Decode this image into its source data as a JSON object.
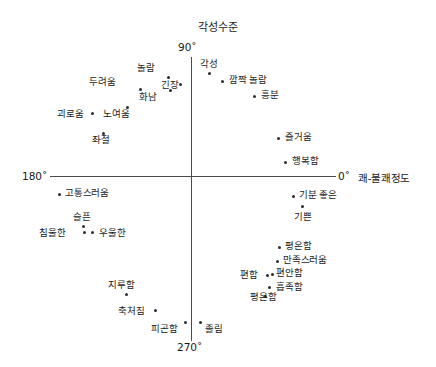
{
  "chart": {
    "title": "각성수준",
    "x_axis_title": "쾌-불쾌정도",
    "tick_top": "90˚",
    "tick_bottom": "270˚",
    "tick_left": "180˚",
    "tick_right": "0˚"
  },
  "chart_data": {
    "type": "scatter",
    "title": "각성수준",
    "xlabel": "쾌-불쾌정도",
    "ylabel": "각성수준",
    "xlim": [
      -100,
      100
    ],
    "ylim": [
      -100,
      100
    ],
    "grid": false,
    "legend": null,
    "annotations": [
      {
        "text": "90˚",
        "position": "top-axis"
      },
      {
        "text": "270˚",
        "position": "bottom-axis"
      },
      {
        "text": "180˚",
        "position": "left-axis"
      },
      {
        "text": "0˚",
        "position": "right-axis"
      }
    ],
    "points": [
      {
        "label": "각성",
        "x": 13,
        "y": 72,
        "px": 209,
        "py": 73,
        "lx": 200,
        "ly": 58,
        "align": "left"
      },
      {
        "label": "깜짝 놀람",
        "x": 22,
        "y": 66,
        "px": 222,
        "py": 81,
        "lx": 229,
        "ly": 74,
        "align": "left"
      },
      {
        "label": "흥분",
        "x": 44,
        "y": 56,
        "px": 254,
        "py": 96,
        "lx": 261,
        "ly": 89,
        "align": "left"
      },
      {
        "label": "즐거움",
        "x": 61,
        "y": 27,
        "px": 278,
        "py": 138,
        "lx": 285,
        "ly": 131,
        "align": "left"
      },
      {
        "label": "행복함",
        "x": 66,
        "y": 10,
        "px": 285,
        "py": 162,
        "lx": 292,
        "ly": 155,
        "align": "left"
      },
      {
        "label": "놀람",
        "x": -16,
        "y": 70,
        "px": 168,
        "py": 77,
        "lx": 137,
        "ly": 62,
        "align": "left"
      },
      {
        "label": "긴장",
        "x": -8,
        "y": 65,
        "px": 180,
        "py": 84,
        "lx": 161,
        "ly": 79,
        "align": "left"
      },
      {
        "label": "두려움",
        "x": -36,
        "y": 62,
        "px": 140,
        "py": 89,
        "lx": 89,
        "ly": 76,
        "align": "left"
      },
      {
        "label": "화남",
        "x": -15,
        "y": 61,
        "px": 170,
        "py": 90,
        "lx": 139,
        "ly": 91,
        "align": "left"
      },
      {
        "label": "노여움",
        "x": -45,
        "y": 49,
        "px": 127,
        "py": 107,
        "lx": 103,
        "ly": 108,
        "align": "left"
      },
      {
        "label": "괴로움",
        "x": -69,
        "y": 44,
        "px": 92,
        "py": 113,
        "lx": 57,
        "ly": 108,
        "align": "left"
      },
      {
        "label": "좌절",
        "x": -62,
        "y": 30,
        "px": 103,
        "py": 133,
        "lx": 92,
        "ly": 134,
        "align": "left"
      },
      {
        "label": "고통스러움",
        "x": -92,
        "y": -13,
        "px": 59,
        "py": 194,
        "lx": 65,
        "ly": 187,
        "align": "left"
      },
      {
        "label": "슬픈",
        "x": -75,
        "y": -35,
        "px": 83,
        "py": 226,
        "lx": 73,
        "ly": 211,
        "align": "left"
      },
      {
        "label": "침울한",
        "x": -75,
        "y": -39,
        "px": 84,
        "py": 232,
        "lx": 39,
        "ly": 227,
        "align": "left"
      },
      {
        "label": "우울한",
        "x": -69,
        "y": -39,
        "px": 92,
        "py": 232,
        "lx": 99,
        "ly": 227,
        "align": "left"
      },
      {
        "label": "기분 좋은",
        "x": 71,
        "y": -14,
        "px": 293,
        "py": 196,
        "lx": 299,
        "ly": 189,
        "align": "left"
      },
      {
        "label": "기쁜",
        "x": 78,
        "y": -21,
        "px": 302,
        "py": 206,
        "lx": 294,
        "ly": 211,
        "align": "left"
      },
      {
        "label": "평온함",
        "x": 62,
        "y": -50,
        "px": 279,
        "py": 247,
        "lx": 285,
        "ly": 240,
        "align": "left"
      },
      {
        "label": "만족스러움",
        "x": 60,
        "y": -60,
        "px": 277,
        "py": 261,
        "lx": 283,
        "ly": 254,
        "align": "left"
      },
      {
        "label": "편함",
        "x": 53,
        "y": -69,
        "px": 267,
        "py": 275,
        "lx": 240,
        "ly": 269,
        "align": "left"
      },
      {
        "label": "편안함",
        "x": 57,
        "y": -69,
        "px": 272,
        "py": 274,
        "lx": 276,
        "ly": 267,
        "align": "left"
      },
      {
        "label": "흡족함",
        "x": 55,
        "y": -78,
        "px": 269,
        "py": 287,
        "lx": 276,
        "ly": 281,
        "align": "left"
      },
      {
        "label": "평온함",
        "x": 50,
        "y": -85,
        "px": 265,
        "py": 296,
        "lx": 250,
        "ly": 291,
        "align": "left"
      },
      {
        "label": "지루함",
        "x": -46,
        "y": -83,
        "px": 126,
        "py": 294,
        "lx": 108,
        "ly": 279,
        "align": "left"
      },
      {
        "label": "축처짐",
        "x": -25,
        "y": -94,
        "px": 155,
        "py": 310,
        "lx": 118,
        "ly": 305,
        "align": "left"
      },
      {
        "label": "피곤함",
        "x": -4,
        "y": -103,
        "px": 185,
        "py": 322,
        "lx": 151,
        "ly": 323,
        "align": "left"
      },
      {
        "label": "졸림",
        "x": 6,
        "y": -103,
        "px": 200,
        "py": 322,
        "lx": 205,
        "ly": 323,
        "align": "left"
      }
    ]
  }
}
